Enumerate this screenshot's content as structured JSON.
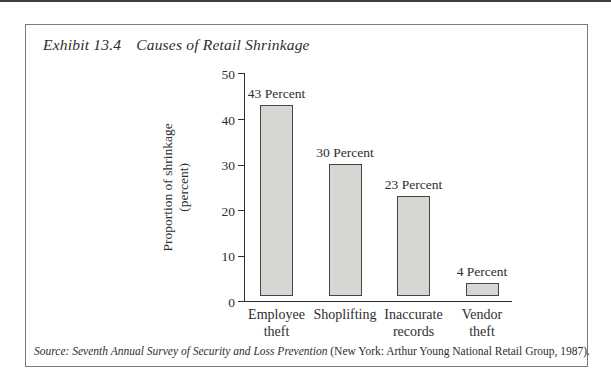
{
  "exhibit": {
    "label": "Exhibit 13.4",
    "title": "Causes of Retail Shrinkage",
    "source_italic": "Source: Seventh Annual Survey of Security and Loss Prevention",
    "source_roman": " (New York: Arthur Young National Retail Group, 1987)."
  },
  "chart_data": {
    "type": "bar",
    "title": "Causes of Retail Shrinkage",
    "categories": [
      "Employee theft",
      "Shoplifting",
      "Inaccurate records",
      "Vendor theft"
    ],
    "category_lines": [
      [
        "Employee",
        "theft"
      ],
      [
        "Shoplifting"
      ],
      [
        "Inaccurate",
        "records"
      ],
      [
        "Vendor",
        "theft"
      ]
    ],
    "values": [
      43,
      30,
      23,
      4
    ],
    "bar_labels": [
      "43 Percent",
      "30 Percent",
      "23 Percent",
      "4 Percent"
    ],
    "xlabel": "",
    "ylabel": "Proportion of shrinkage (percent)",
    "ylabel_lines": [
      "Proportion of shrinkage",
      "(percent)"
    ],
    "yticks": [
      0,
      10,
      20,
      30,
      40,
      50
    ],
    "ylim": [
      0,
      50
    ],
    "grid": false,
    "legend": "none",
    "colors": {
      "bar_fill": "#d6d6d3",
      "bar_border": "#454545",
      "axis": "#2e2e2e",
      "frame_border": "#7a7a7a",
      "top_rule": "#3d3d3d"
    }
  }
}
